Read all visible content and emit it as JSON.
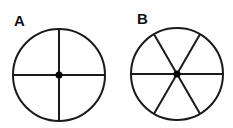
{
  "figures": [
    {
      "label": "A",
      "divisions": 4,
      "rotation_deg": 0
    },
    {
      "label": "B",
      "divisions": 6,
      "rotation_deg": 0
    }
  ],
  "colors": {
    "stroke": "#1a1a1a",
    "center_dot": "#000000",
    "background": "#ffffff"
  }
}
